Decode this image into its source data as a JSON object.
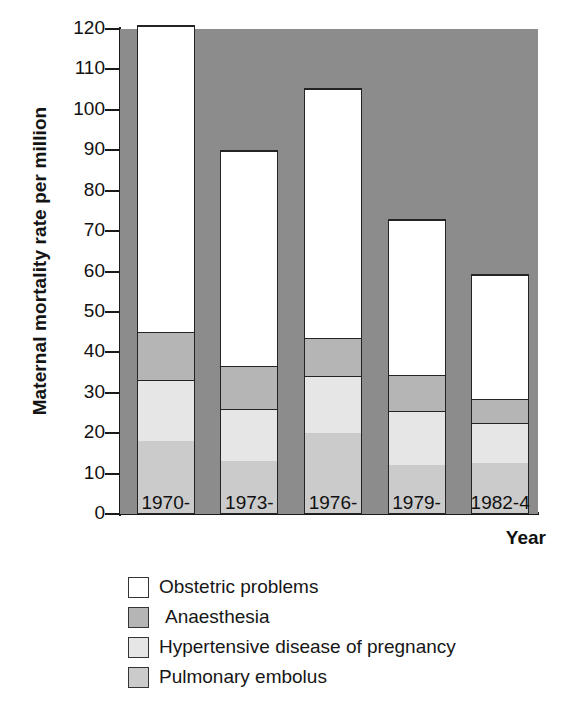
{
  "chart_data": {
    "type": "bar",
    "subtype": "stacked-vertical",
    "title": "",
    "xlabel": "Year",
    "ylabel": "Maternal mortality rate per million",
    "categories": [
      "1970-",
      "1973-",
      "1976-",
      "1979-",
      "1982-4"
    ],
    "ylim": [
      0,
      120
    ],
    "yticks": [
      0,
      10,
      20,
      30,
      40,
      50,
      60,
      70,
      80,
      90,
      100,
      110,
      120
    ],
    "ytick_labels": [
      "0",
      "10",
      "20",
      "30",
      "40",
      "50",
      "60",
      "70",
      "80",
      "90",
      "100",
      "110",
      "120"
    ],
    "grid": false,
    "legend_position": "below",
    "series": [
      {
        "name": "Pulmonary embolus",
        "color": "#cbcbcb",
        "values": [
          18,
          13,
          20,
          12,
          12.5
        ]
      },
      {
        "name": "Hypertensive disease of pregnancy",
        "color": "#e6e6e6",
        "values": [
          15,
          13,
          14,
          13.5,
          10
        ]
      },
      {
        "name": "Anaesthesia",
        "color": "#b5b5b5",
        "values": [
          12,
          10.5,
          9.5,
          9,
          6
        ]
      },
      {
        "name": "Obstetric problems",
        "color": "#ffffff",
        "values": [
          76,
          53.5,
          62,
          38.5,
          31
        ]
      }
    ],
    "totals": [
      121,
      90,
      105.5,
      73,
      59.5
    ],
    "cumulative_tops": {
      "pulmonary_embolus": [
        18,
        13,
        20,
        12,
        12.5
      ],
      "hypertensive_disease_of_pregnancy": [
        33,
        26,
        34,
        25.5,
        22.5
      ],
      "anaesthesia": [
        45,
        36.5,
        43.5,
        34.5,
        28.5
      ],
      "obstetric_problems": [
        121,
        90,
        105.5,
        73,
        59.5
      ]
    },
    "plot_background_color": "#8c8c8c"
  },
  "axes": {
    "y_title": "Maternal mortality rate per million",
    "x_title": "Year"
  },
  "legend": {
    "items": [
      {
        "label": "Obstetric problems",
        "color": "#ffffff"
      },
      {
        "label": "Anaesthesia",
        "color": "#b5b5b5"
      },
      {
        "label": "Hypertensive disease of pregnancy",
        "color": "#e6e6e6"
      },
      {
        "label": "Pulmonary embolus",
        "color": "#cbcbcb"
      }
    ]
  }
}
